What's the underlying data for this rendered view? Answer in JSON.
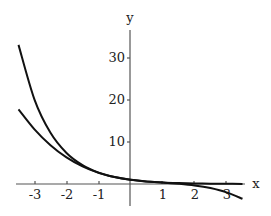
{
  "chart_data": {
    "type": "line",
    "title": "",
    "xlabel": "x",
    "ylabel": "y",
    "xlim": [
      -3.5,
      3.5
    ],
    "ylim": [
      -4,
      35
    ],
    "grid": false,
    "legend": null,
    "x_ticks": [
      "-3",
      "-2",
      "-1",
      "1",
      "2",
      "3"
    ],
    "y_ticks": [
      "10",
      "20",
      "30"
    ],
    "x": [
      -3.5,
      -3.0,
      -2.5,
      -2.0,
      -1.5,
      -1.0,
      -0.5,
      0.0,
      0.5,
      1.0,
      1.5,
      2.0,
      2.5,
      3.0,
      3.5
    ],
    "series": [
      {
        "name": "exp(-x)",
        "values": [
          33.12,
          20.09,
          12.18,
          7.39,
          4.48,
          2.72,
          1.65,
          1.0,
          0.61,
          0.37,
          0.22,
          0.14,
          0.08,
          0.05,
          0.03
        ]
      },
      {
        "name": "1 - x + x^2/2 - x^3/6",
        "values": [
          17.77,
          13.0,
          9.23,
          6.33,
          4.19,
          2.67,
          1.65,
          1.0,
          0.6,
          0.33,
          0.06,
          -0.33,
          -0.98,
          -2.0,
          -3.52
        ]
      }
    ]
  },
  "labels": {
    "x_axis": "x",
    "y_axis": "y",
    "x_ticks": [
      "-3",
      "-2",
      "-1",
      "1",
      "2",
      "3"
    ],
    "y_ticks": [
      "10",
      "20",
      "30"
    ]
  }
}
